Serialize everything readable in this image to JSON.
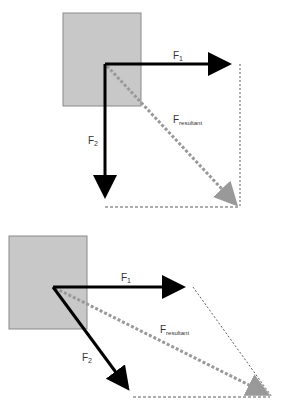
{
  "diagrams": [
    {
      "id": "perpendicular-forces",
      "labels": {
        "f1": "F",
        "f1_sub": "1",
        "f2": "F",
        "f2_sub": "2",
        "fr": "F",
        "fr_sub": "resultant"
      }
    },
    {
      "id": "angled-forces",
      "labels": {
        "f1": "F",
        "f1_sub": "1",
        "f2": "F",
        "f2_sub": "2",
        "fr": "F",
        "fr_sub": "resultant"
      }
    }
  ],
  "colors": {
    "box_fill": "#c8c8c8",
    "box_stroke": "#8a8a8a",
    "force": "#000000",
    "resultant": "#999999",
    "guide": "#333333"
  }
}
